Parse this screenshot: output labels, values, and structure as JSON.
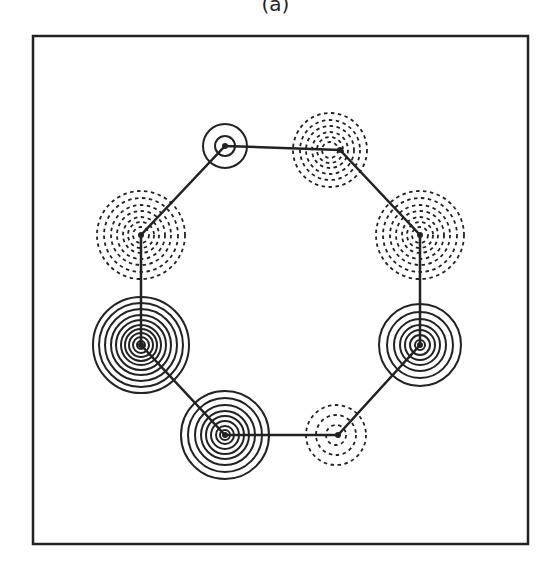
{
  "figure": {
    "panel_label": "(a)",
    "frame": {
      "x": 33,
      "y": 36,
      "w": 495,
      "h": 508
    },
    "line_color": "#222222",
    "ring": {
      "vertices": [
        [
          225,
          146
        ],
        [
          340,
          150
        ],
        [
          420,
          235
        ],
        [
          420,
          345
        ],
        [
          338,
          435
        ],
        [
          225,
          435
        ],
        [
          141,
          345
        ],
        [
          141,
          235
        ]
      ]
    },
    "atoms": [
      {
        "id": "top-left",
        "cx": 225,
        "cy": 146,
        "style": "solid",
        "radii": [
          10,
          22
        ]
      },
      {
        "id": "top-right",
        "cx": 330,
        "cy": 150,
        "style": "dashed",
        "radii": [
          8,
          13,
          18,
          24,
          30,
          37
        ]
      },
      {
        "id": "right-upper",
        "cx": 420,
        "cy": 235,
        "style": "dashed",
        "radii": [
          8,
          13,
          18,
          24,
          30,
          37,
          44
        ]
      },
      {
        "id": "right-lower",
        "cx": 420,
        "cy": 345,
        "style": "solid",
        "radii": [
          5,
          10,
          15,
          20,
          26,
          33,
          41
        ]
      },
      {
        "id": "bottom-right",
        "cx": 336,
        "cy": 435,
        "style": "dashed",
        "radii": [
          10,
          20,
          30
        ]
      },
      {
        "id": "bottom-left",
        "cx": 225,
        "cy": 435,
        "style": "solid",
        "radii": [
          5,
          9,
          14,
          19,
          24,
          30,
          37,
          44
        ]
      },
      {
        "id": "left-lower",
        "cx": 141,
        "cy": 345,
        "style": "solid",
        "radii": [
          4,
          8,
          12,
          16,
          20,
          25,
          30,
          36,
          42,
          48
        ]
      },
      {
        "id": "left-upper",
        "cx": 141,
        "cy": 235,
        "style": "dashed",
        "radii": [
          8,
          13,
          18,
          24,
          30,
          37,
          44
        ]
      }
    ]
  }
}
